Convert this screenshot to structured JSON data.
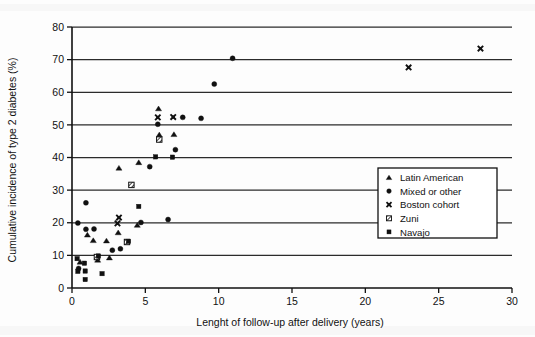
{
  "figure": {
    "background_color": "#ffffff",
    "ink_color": "#111111"
  },
  "chart_data": {
    "type": "scatter",
    "title": "",
    "subtitle": "",
    "xlabel": "Lenght of follow-up after delivery (years)",
    "ylabel": "Cumulative incidence of type 2 diabetes (%)",
    "xlim": [
      0,
      30
    ],
    "ylim": [
      0,
      80
    ],
    "xticks": [
      0,
      5,
      10,
      15,
      20,
      25,
      30
    ],
    "yticks": [
      0,
      10,
      20,
      30,
      40,
      50,
      60,
      70,
      80
    ],
    "xticklabels": [
      "0",
      "5",
      "10",
      "15",
      "20",
      "25",
      "30"
    ],
    "yticklabels": [
      "0",
      "10",
      "20",
      "30",
      "40",
      "50",
      "60",
      "70",
      "80"
    ],
    "grid": "horizontal",
    "gridlines_y": [
      10,
      20,
      30,
      40,
      50,
      60,
      70,
      80
    ],
    "legend_position": "center-right",
    "legend_title": "",
    "series": [
      {
        "name": "Latin American",
        "marker": "triangle",
        "color": "#111111",
        "points": [
          [
            0.55,
            8.0
          ],
          [
            1.05,
            16.3
          ],
          [
            1.45,
            14.6
          ],
          [
            1.75,
            8.6
          ],
          [
            2.35,
            14.5
          ],
          [
            2.55,
            9.3
          ],
          [
            3.15,
            17.0
          ],
          [
            3.2,
            36.8
          ],
          [
            4.45,
            19.3
          ],
          [
            4.55,
            38.5
          ],
          [
            5.9,
            55.0
          ],
          [
            5.95,
            47.0
          ],
          [
            6.95,
            47.1
          ]
        ]
      },
      {
        "name": "Mixed or other",
        "marker": "circle",
        "color": "#111111",
        "points": [
          [
            0.4,
            19.9
          ],
          [
            0.45,
            6.0
          ],
          [
            0.95,
            26.1
          ],
          [
            0.95,
            18.0
          ],
          [
            1.5,
            18.1
          ],
          [
            2.75,
            11.6
          ],
          [
            3.3,
            12.0
          ],
          [
            4.7,
            20.1
          ],
          [
            5.3,
            37.2
          ],
          [
            5.85,
            50.2
          ],
          [
            6.55,
            21.0
          ],
          [
            7.05,
            42.4
          ],
          [
            7.55,
            52.3
          ],
          [
            8.8,
            52.0
          ],
          [
            9.7,
            62.5
          ],
          [
            10.95,
            70.4
          ]
        ]
      },
      {
        "name": "Boston cohort",
        "marker": "x",
        "color": "#111111",
        "points": [
          [
            3.1,
            19.8
          ],
          [
            3.2,
            21.6
          ],
          [
            5.85,
            52.3
          ],
          [
            6.9,
            52.4
          ],
          [
            22.95,
            67.6
          ],
          [
            27.85,
            73.4
          ]
        ]
      },
      {
        "name": "Zuni",
        "marker": "square-hatched",
        "color": "#111111",
        "points": [
          [
            1.7,
            9.5
          ],
          [
            3.75,
            14.1
          ],
          [
            4.05,
            31.6
          ],
          [
            5.95,
            45.5
          ]
        ]
      },
      {
        "name": "Navajo",
        "marker": "small-square",
        "color": "#111111",
        "points": [
          [
            0.35,
            9.0
          ],
          [
            0.4,
            5.1
          ],
          [
            0.85,
            7.6
          ],
          [
            0.9,
            5.2
          ],
          [
            0.9,
            2.6
          ],
          [
            1.8,
            9.8
          ],
          [
            2.05,
            4.4
          ],
          [
            3.85,
            14.3
          ],
          [
            4.55,
            25.0
          ],
          [
            5.7,
            40.2
          ],
          [
            6.85,
            40.1
          ]
        ]
      }
    ]
  },
  "legend": {
    "items": [
      {
        "label": "Latin American",
        "marker": "triangle"
      },
      {
        "label": "Mixed or other",
        "marker": "circle"
      },
      {
        "label": "Boston cohort",
        "marker": "x"
      },
      {
        "label": "Zuni",
        "marker": "square-hatched"
      },
      {
        "label": "Navajo",
        "marker": "small-square"
      }
    ]
  }
}
